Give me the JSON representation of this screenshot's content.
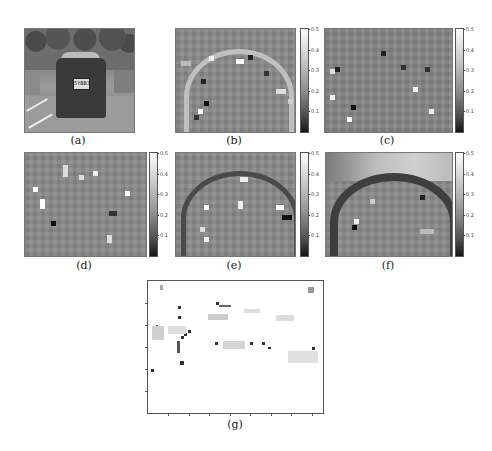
{
  "figure": {
    "panels": [
      {
        "id": "a",
        "caption": "(a)",
        "type": "photo",
        "content": "rear view of car in parking lot",
        "plate_text": "5YBB3"
      },
      {
        "id": "b",
        "caption": "(b)",
        "type": "heatmap",
        "colorbar": [
          "0.5",
          "0.4",
          "0.3",
          "0.2",
          "0.1"
        ]
      },
      {
        "id": "c",
        "caption": "(c)",
        "type": "heatmap",
        "colorbar": [
          "0.5",
          "0.4",
          "0.3",
          "0.2",
          "0.1"
        ]
      },
      {
        "id": "d",
        "caption": "(d)",
        "type": "heatmap",
        "colorbar": [
          "0.5",
          "0.4",
          "0.3",
          "0.2",
          "0.1"
        ]
      },
      {
        "id": "e",
        "caption": "(e)",
        "type": "heatmap",
        "colorbar": [
          "0.5",
          "0.4",
          "0.3",
          "0.2",
          "0.1"
        ]
      },
      {
        "id": "f",
        "caption": "(f)",
        "type": "heatmap",
        "colorbar": [
          "0.5",
          "0.4",
          "0.3",
          "0.2",
          "0.1"
        ]
      },
      {
        "id": "g",
        "caption": "(g)",
        "type": "sparse-map"
      }
    ]
  },
  "colors": {
    "background": "#ffffff",
    "heatmap_base": "#8b8b8b",
    "colorbar_top": "#ffffff",
    "colorbar_bottom": "#151515"
  }
}
